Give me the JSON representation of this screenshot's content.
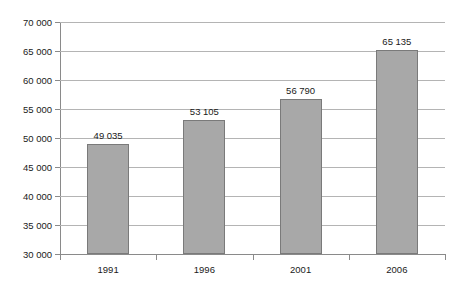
{
  "chart_data": {
    "type": "bar",
    "title": "",
    "subtitle": "",
    "xlabel": "",
    "ylabel": "",
    "categories": [
      "1991",
      "1996",
      "2001",
      "2006"
    ],
    "values": [
      49035,
      53105,
      56790,
      65135
    ],
    "value_labels": [
      "49 035",
      "53 105",
      "56 790",
      "65 135"
    ],
    "ylim": [
      30000,
      70000
    ],
    "ytick_values": [
      30000,
      35000,
      40000,
      45000,
      50000,
      55000,
      60000,
      65000,
      70000
    ],
    "ytick_labels": [
      "30 000",
      "35 000",
      "40 000",
      "45 000",
      "50 000",
      "55 000",
      "60 000",
      "65 000",
      "70 000"
    ],
    "grid": true,
    "legend": false,
    "legend_position": "none",
    "colors": {
      "bar_fill": "#a8a8a8",
      "bar_border": "#7a7a7a",
      "gridline": "#b4b4b4",
      "axis": "#8a8a8a",
      "text": "#1a1a1a",
      "background": "#ffffff"
    }
  }
}
